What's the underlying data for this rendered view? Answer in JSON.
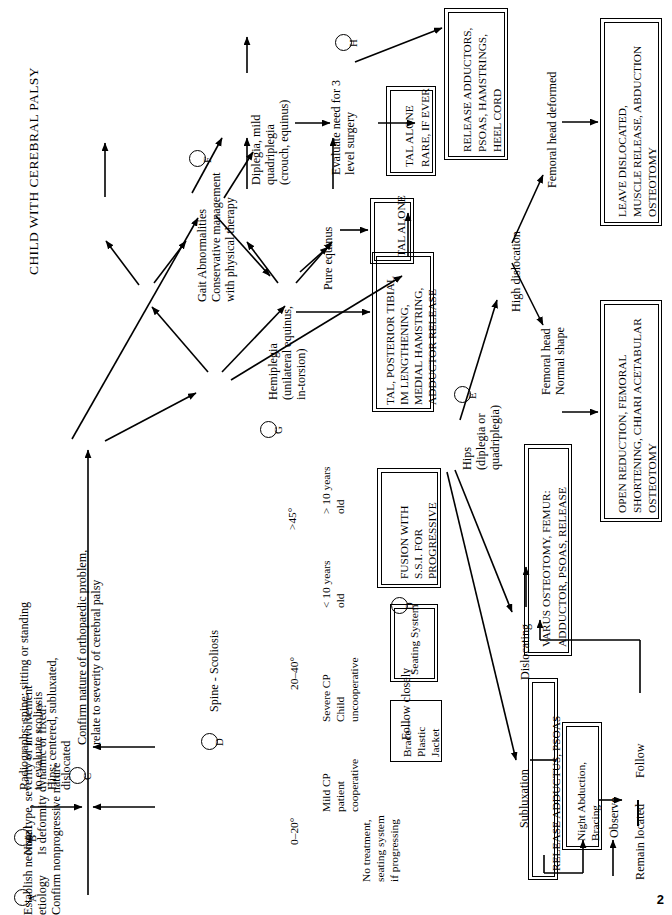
{
  "document": {
    "title": "CHILD WITH CEREBRAL PALSY",
    "page_number": "2",
    "orientation": "rotated-90-ccw"
  },
  "steps": {
    "a": {
      "marker": "A",
      "lines": [
        "Establish neonatal",
        "etiology",
        "Confirm nonprogressive nature"
      ],
      "text": "Establish neonatal etiology Confirm nonprogressive nature"
    },
    "b": {
      "marker": "B",
      "lines": [
        "Note type, severity of involvement",
        "Is deformity dynamic or fixed?"
      ],
      "text": "Note type, severity of involvement Is deformity dynamic or fixed?"
    },
    "radiographs": {
      "lines": [
        "Radiographs: spine: sitting or standing",
        "to evaluate scoliosis",
        "Hips: centered, subluxated,",
        "dislocated"
      ],
      "text": "Radiographs: spine: sitting or standing to evaluate scoliosis Hips: centered, subluxated, dislocated"
    },
    "c": {
      "marker": "C",
      "lines": [
        "Confirm nature of orthopaedic problem,",
        "relate to severity of cerebral palsy"
      ],
      "text": "Confirm nature of orthopaedic problem, relate to severity of cerebral palsy"
    }
  },
  "spine_branch": {
    "marker": "D",
    "root": "Spine - Scoliosis",
    "angles": {
      "severe": ">45°",
      "moderate": "20–40°",
      "mild": "0–20°"
    },
    "severe_paths": [
      {
        "label_lines": [
          "> 10 years",
          "old"
        ],
        "label": "> 10 years old"
      },
      {
        "label_lines": [
          "< 10 years",
          "old"
        ],
        "label": "< 10 years old"
      }
    ],
    "moderate_paths": [
      {
        "label_lines": [
          "Severe CP",
          "Child",
          "uncooperative"
        ],
        "label": "Severe CP Child uncooperative"
      },
      {
        "label_lines": [
          "Mild CP",
          "patient",
          "cooperative"
        ],
        "label": "Mild CP patient cooperative"
      }
    ],
    "mild_outcome": {
      "lines": [
        "No treatment,",
        "seating system",
        "if progressing"
      ],
      "text": "No treatment, seating system if progressing"
    },
    "boxes": {
      "fusion": {
        "lines": [
          "FUSION WITH",
          "S.S.I. FOR",
          "PROGRESSIVE"
        ],
        "text": "FUSION WITH S.S.I. FOR PROGRESSIVE",
        "marker": "D",
        "double_border": true
      },
      "seating": {
        "lines": [
          "Seating System"
        ],
        "text": "Seating System",
        "double_border": true
      },
      "brace": {
        "lines": [
          "Brace—",
          "Plastic",
          "Jacket"
        ],
        "text": "Brace—Plastic Jacket",
        "double_border": false
      }
    },
    "follow": "Follow closely"
  },
  "gait_branch": {
    "marker": "F",
    "heading_lines": [
      "Gait Abnormalities",
      "Conservative management",
      "with physical therapy"
    ],
    "heading": "Gait Abnormalities Conservative management with physical therapy",
    "diplegia": {
      "lines": [
        "Diplegia, mild",
        "quadriplegia",
        "(crouch, equinus)"
      ],
      "text": "Diplegia, mild quadriplegia (crouch, equinus)"
    },
    "evaluate": {
      "marker": "H",
      "lines": [
        "Evaluate need for 3",
        "level surgery"
      ],
      "text": "Evaluate need for 3 level surgery"
    },
    "tal_alone_rare": {
      "lines": [
        "TAL ALONE",
        "RARE, IF EVER"
      ],
      "text": "TAL ALONE RARE, IF EVER",
      "double_border": true
    },
    "release_adductors": {
      "lines": [
        "RELEASE ADDUCTORS,",
        "PSOAS, HAMSTRINGS,",
        "HEEL CORD"
      ],
      "text": "RELEASE ADDUCTORS, PSOAS, HAMSTRINGS, HEEL CORD",
      "double_border": true
    },
    "hemiplegia": {
      "marker": "G",
      "lines": [
        "Hemiplegia",
        "(unilateral equinus,",
        "in-torsion)"
      ],
      "text": "Hemiplegia (unilateral equinus, in-torsion)"
    },
    "pure_equinus": "Pure equinus",
    "tal_alone": {
      "lines": [
        "TAL ALONE"
      ],
      "text": "TAL ALONE",
      "double_border": true
    },
    "tal_posterior": {
      "lines": [
        "TAL, POSTERIOR TIBIAL",
        "IM LENGTHENING,",
        "MEDIAL HAMSTRING,",
        "ADDUCTOR RELEASE"
      ],
      "text": "TAL, POSTERIOR TIBIAL IM LENGTHENING, MEDIAL HAMSTRING, ADDUCTOR RELEASE",
      "double_border": true
    }
  },
  "hip_branch": {
    "marker": "E",
    "heading_lines": [
      "Hips",
      "(diplegia or",
      "quadriplegia)"
    ],
    "heading": "Hips (diplegia or quadriplegia)",
    "high_dislocation": {
      "label": "High dislocation",
      "deformed": {
        "lines": [
          "Femoral head deformed"
        ],
        "text": "Femoral head deformed"
      },
      "normal": {
        "lines": [
          "Femoral head",
          "Normal shape"
        ],
        "text": "Femoral head Normal shape"
      },
      "deformed_box": {
        "lines": [
          "LEAVE DISLOCATED,",
          "MUSCLE RELEASE, ABDUCTION",
          "OSTEOTOMY"
        ],
        "text": "LEAVE DISLOCATED, MUSCLE RELEASE, ABDUCTION OSTEOTOMY",
        "double_border": true
      },
      "normal_box": {
        "lines": [
          "OPEN REDUCTION, FEMORAL",
          "SHORTENING, CHIARI ACETABULAR",
          "OSTEOTOMY"
        ],
        "text": "OPEN REDUCTION, FEMORAL SHORTENING, CHIARI ACETABULAR OSTEOTOMY",
        "double_border": true
      }
    },
    "dislocating": {
      "label": "Dislocating",
      "box": {
        "lines": [
          "VARUS OSTEOTOMY, FEMUR:",
          "ADDUCTOR, PSOAS, RELEASE"
        ],
        "text": "VARUS OSTEOTOMY, FEMUR: ADDUCTOR, PSOAS, RELEASE",
        "double_border": true
      }
    },
    "subluxation": {
      "label": "Subluxation",
      "box": {
        "lines": [
          "RELEASE ADDUCTUS, PSOAS"
        ],
        "text": "RELEASE ADDUCTUS, PSOAS",
        "double_border": true
      },
      "night_box": {
        "lines": [
          "Night Abduction,",
          "Bracing"
        ],
        "text": "Night Abduction, Bracing",
        "double_border": true
      },
      "observe": "Observe",
      "remain_located": "Remain located",
      "follow": "Follow"
    }
  }
}
